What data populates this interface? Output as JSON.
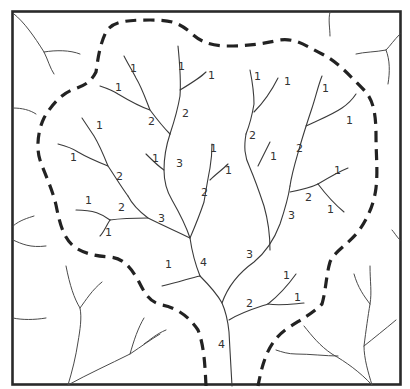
{
  "diagram": {
    "type": "drainage-basin-stream-order",
    "colors": {
      "line": "#3a3a3a",
      "divide": "#222222",
      "frame": "#2a2a2a",
      "background": "#ffffff"
    },
    "legend_orders": [
      "1",
      "2",
      "3",
      "4"
    ],
    "labels": [
      {
        "id": "l01",
        "text": "1",
        "x": 178,
        "y": 70
      },
      {
        "id": "l02",
        "text": "1",
        "x": 208,
        "y": 79
      },
      {
        "id": "l03",
        "text": "1",
        "x": 130,
        "y": 72
      },
      {
        "id": "l04",
        "text": "1",
        "x": 115,
        "y": 91
      },
      {
        "id": "l05",
        "text": "2",
        "x": 182,
        "y": 117
      },
      {
        "id": "l06",
        "text": "2",
        "x": 148,
        "y": 125
      },
      {
        "id": "l07",
        "text": "1",
        "x": 96,
        "y": 129
      },
      {
        "id": "l08",
        "text": "1",
        "x": 70,
        "y": 161
      },
      {
        "id": "l09",
        "text": "2",
        "x": 116,
        "y": 180
      },
      {
        "id": "l10",
        "text": "1",
        "x": 152,
        "y": 162
      },
      {
        "id": "l11",
        "text": "3",
        "x": 176,
        "y": 167
      },
      {
        "id": "l12",
        "text": "1",
        "x": 210,
        "y": 152
      },
      {
        "id": "l13",
        "text": "1",
        "x": 225,
        "y": 174
      },
      {
        "id": "l14",
        "text": "2",
        "x": 201,
        "y": 196
      },
      {
        "id": "l15",
        "text": "1",
        "x": 85,
        "y": 204
      },
      {
        "id": "l16",
        "text": "2",
        "x": 118,
        "y": 211
      },
      {
        "id": "l17",
        "text": "1",
        "x": 105,
        "y": 236
      },
      {
        "id": "l18",
        "text": "3",
        "x": 158,
        "y": 222
      },
      {
        "id": "l19",
        "text": "1",
        "x": 165,
        "y": 268
      },
      {
        "id": "l20",
        "text": "4",
        "x": 200,
        "y": 266
      },
      {
        "id": "l21",
        "text": "1",
        "x": 254,
        "y": 80
      },
      {
        "id": "l22",
        "text": "1",
        "x": 284,
        "y": 85
      },
      {
        "id": "l23",
        "text": "2",
        "x": 249,
        "y": 139
      },
      {
        "id": "l24",
        "text": "1",
        "x": 270,
        "y": 160
      },
      {
        "id": "l25",
        "text": "1",
        "x": 322,
        "y": 92
      },
      {
        "id": "l26",
        "text": "1",
        "x": 346,
        "y": 124
      },
      {
        "id": "l27",
        "text": "2",
        "x": 296,
        "y": 152
      },
      {
        "id": "l28",
        "text": "1",
        "x": 334,
        "y": 174
      },
      {
        "id": "l29",
        "text": "2",
        "x": 305,
        "y": 201
      },
      {
        "id": "l30",
        "text": "1",
        "x": 327,
        "y": 213
      },
      {
        "id": "l31",
        "text": "3",
        "x": 288,
        "y": 219
      },
      {
        "id": "l32",
        "text": "3",
        "x": 246,
        "y": 258
      },
      {
        "id": "l33",
        "text": "1",
        "x": 283,
        "y": 279
      },
      {
        "id": "l34",
        "text": "2",
        "x": 246,
        "y": 307
      },
      {
        "id": "l35",
        "text": "1",
        "x": 294,
        "y": 301
      },
      {
        "id": "l36",
        "text": "4",
        "x": 218,
        "y": 348
      }
    ]
  }
}
